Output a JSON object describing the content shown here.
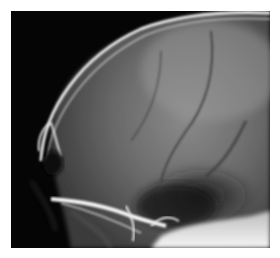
{
  "image": {
    "subject": "Lateral skull radiograph",
    "alt": "Black-and-white lateral X-ray of a skull showing cranial vault, orbit and skull base",
    "colors": {
      "background": "#ffffff",
      "film": "#050505",
      "bone": "#f2f2f2"
    }
  }
}
